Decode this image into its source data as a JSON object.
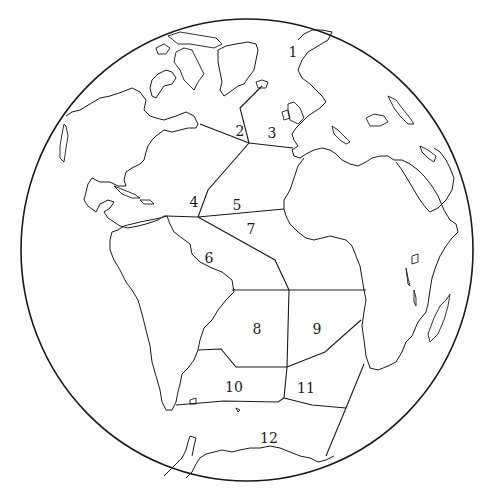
{
  "map": {
    "projection": "orthographic globe centered on Atlantic Ocean",
    "regions": [
      {
        "id": "1",
        "label": "1",
        "x": 293,
        "y": 52
      },
      {
        "id": "2",
        "label": "2",
        "x": 240,
        "y": 131
      },
      {
        "id": "3",
        "label": "3",
        "x": 272,
        "y": 133
      },
      {
        "id": "4",
        "label": "4",
        "x": 194,
        "y": 202
      },
      {
        "id": "5",
        "label": "5",
        "x": 237,
        "y": 205
      },
      {
        "id": "6",
        "label": "6",
        "x": 209,
        "y": 258
      },
      {
        "id": "7",
        "label": "7",
        "x": 251,
        "y": 229
      },
      {
        "id": "8",
        "label": "8",
        "x": 257,
        "y": 329
      },
      {
        "id": "9",
        "label": "9",
        "x": 317,
        "y": 329
      },
      {
        "id": "10",
        "label": "10",
        "x": 234,
        "y": 387
      },
      {
        "id": "11",
        "label": "11",
        "x": 306,
        "y": 388
      },
      {
        "id": "12",
        "label": "12",
        "x": 269,
        "y": 438
      }
    ],
    "colors": {
      "line": "#1a1a1a",
      "background": "#ffffff"
    }
  }
}
